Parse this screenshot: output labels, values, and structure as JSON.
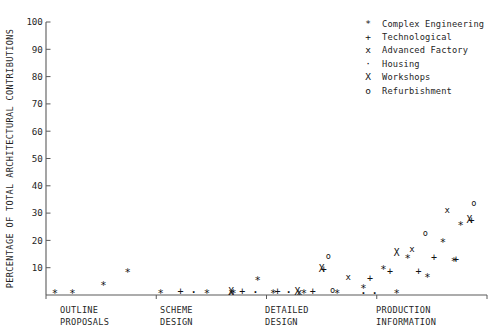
{
  "chart_data": {
    "type": "scatter",
    "title": "",
    "subtitle": "",
    "xlabel": "",
    "ylabel": "PERCENTAGE OF TOTAL ARCHITECTURAL CONTRIBUTIONS",
    "ylim": [
      0,
      100
    ],
    "ytick_labels": [
      "100",
      "90",
      "80",
      "70",
      "60",
      "50",
      "40",
      "30",
      "20",
      "10"
    ],
    "ytick_values": [
      100,
      90,
      80,
      70,
      60,
      50,
      40,
      30,
      20,
      10
    ],
    "grid": false,
    "legend_position": "top-right",
    "categories": [
      {
        "line1": "OUTLINE",
        "line2": "PROPOSALS"
      },
      {
        "line1": "SCHEME",
        "line2": "DESIGN"
      },
      {
        "line1": "DETAILED",
        "line2": "DESIGN"
      },
      {
        "line1": "PRODUCTION",
        "line2": "INFORMATION"
      }
    ],
    "legend": [
      {
        "marker": "*",
        "glyph": "asterisk-marker",
        "label": "Complex Engineering"
      },
      {
        "marker": "+",
        "glyph": "plus-marker",
        "label": "Technological"
      },
      {
        "marker": "x",
        "glyph": "lowercase-x-marker",
        "label": "Advanced Factory"
      },
      {
        "marker": "·",
        "glyph": "dot-marker",
        "label": "Housing"
      },
      {
        "marker": "X",
        "glyph": "uppercase-x-marker",
        "label": "Workshops"
      },
      {
        "marker": "o",
        "glyph": "circle-marker",
        "label": "Refurbishment"
      }
    ],
    "series": [
      {
        "name": "Complex Engineering",
        "marker": "*",
        "points": [
          {
            "x": 2.0,
            "y": 1.0
          },
          {
            "x": 6.0,
            "y": 1.0
          },
          {
            "x": 13.0,
            "y": 4.0
          },
          {
            "x": 18.5,
            "y": 9.0
          },
          {
            "x": 26.0,
            "y": 1.0
          },
          {
            "x": 36.5,
            "y": 1.0
          },
          {
            "x": 42.5,
            "y": 1.0
          },
          {
            "x": 48.0,
            "y": 6.0
          },
          {
            "x": 51.5,
            "y": 1.0
          },
          {
            "x": 58.5,
            "y": 1.0
          },
          {
            "x": 66.0,
            "y": 1.0
          },
          {
            "x": 72.0,
            "y": 3.0
          },
          {
            "x": 76.5,
            "y": 10.0
          },
          {
            "x": 79.5,
            "y": 1.0
          },
          {
            "x": 82.0,
            "y": 14.0
          },
          {
            "x": 86.5,
            "y": 7.0
          },
          {
            "x": 90.0,
            "y": 20.0
          },
          {
            "x": 92.5,
            "y": 13.0
          },
          {
            "x": 94.0,
            "y": 26.0
          }
        ]
      },
      {
        "name": "Technological",
        "marker": "+",
        "points": [
          {
            "x": 30.5,
            "y": 1.0
          },
          {
            "x": 44.5,
            "y": 1.0
          },
          {
            "x": 52.5,
            "y": 1.0
          },
          {
            "x": 60.5,
            "y": 1.0
          },
          {
            "x": 63.0,
            "y": 9.0
          },
          {
            "x": 73.5,
            "y": 6.0
          },
          {
            "x": 78.0,
            "y": 8.5
          },
          {
            "x": 84.5,
            "y": 8.5
          },
          {
            "x": 88.0,
            "y": 13.5
          },
          {
            "x": 93.0,
            "y": 13.0
          },
          {
            "x": 96.5,
            "y": 27.0
          }
        ]
      },
      {
        "name": "Advanced Factory",
        "marker": "x",
        "points": [
          {
            "x": 42.0,
            "y": 1.0
          },
          {
            "x": 57.5,
            "y": 1.0
          },
          {
            "x": 68.5,
            "y": 6.5
          },
          {
            "x": 83.0,
            "y": 16.5
          },
          {
            "x": 91.0,
            "y": 31.0
          }
        ]
      },
      {
        "name": "Housing",
        "marker": "·",
        "points": [
          {
            "x": 33.5,
            "y": 1.0
          },
          {
            "x": 47.5,
            "y": 1.0
          },
          {
            "x": 55.0,
            "y": 1.0
          },
          {
            "x": 72.0,
            "y": 0.5
          },
          {
            "x": 74.5,
            "y": 0.5
          }
        ]
      },
      {
        "name": "Workshops",
        "marker": "X",
        "points": [
          {
            "x": 42.0,
            "y": 1.0
          },
          {
            "x": 57.0,
            "y": 1.0
          },
          {
            "x": 62.5,
            "y": 9.5
          },
          {
            "x": 79.5,
            "y": 15.5
          },
          {
            "x": 96.0,
            "y": 27.5
          }
        ]
      },
      {
        "name": "Refurbishment",
        "marker": "o",
        "points": [
          {
            "x": 65.0,
            "y": 1.5
          },
          {
            "x": 64.0,
            "y": 14.0
          },
          {
            "x": 86.0,
            "y": 22.5
          },
          {
            "x": 97.0,
            "y": 33.5
          }
        ]
      }
    ]
  }
}
